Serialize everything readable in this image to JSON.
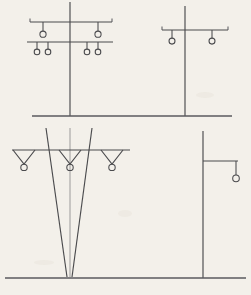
{
  "document": {
    "title": "Utility Pole Configuration Line Drawings",
    "background_color": "#f3f0ea",
    "line_color": "#4a4a4d",
    "width": 251,
    "height": 295
  },
  "figures": [
    {
      "id": "fig-top-left",
      "name": "double-crossarm-pole",
      "label": "Double Crossarm Distribution Pole",
      "pole": {
        "x": 70,
        "top_y": 2,
        "bottom_y": 116
      },
      "crossarms": [
        {
          "name": "upper-crossarm",
          "y": 22,
          "x1": 30,
          "x2": 112,
          "insulators": [
            {
              "x": 43,
              "drop": 9,
              "r": 3.1
            },
            {
              "x": 98,
              "drop": 9,
              "r": 3.1
            }
          ]
        },
        {
          "name": "lower-crossarm",
          "y": 42,
          "x1": 27,
          "x2": 113,
          "insulators": [
            {
              "x": 37,
              "drop": 7,
              "r": 2.8
            },
            {
              "x": 48,
              "drop": 7,
              "r": 2.8
            },
            {
              "x": 87,
              "drop": 7,
              "r": 2.8
            },
            {
              "x": 98,
              "drop": 7,
              "r": 2.8
            }
          ]
        }
      ],
      "insulator_count": 6
    },
    {
      "id": "fig-top-right",
      "name": "single-crossarm-pole",
      "label": "Single Crossarm Pole",
      "pole": {
        "x": 185,
        "top_y": 6,
        "bottom_y": 116
      },
      "crossarms": [
        {
          "name": "crossarm",
          "y": 30,
          "x1": 162,
          "x2": 228,
          "insulators": [
            {
              "x": 172,
              "drop": 8,
              "r": 3.0
            },
            {
              "x": 212,
              "drop": 8,
              "r": 3.0
            }
          ]
        }
      ],
      "insulator_count": 2
    },
    {
      "id": "fig-bottom-left",
      "name": "lattice-tower-front-elevation",
      "label": "Lattice Tower Front Elevation",
      "crossarm": {
        "name": "tower-crossarm",
        "y": 150,
        "x1": 12,
        "x2": 130,
        "v_hangers": [
          {
            "x": 24,
            "half_width": 11,
            "depth": 14,
            "r": 3.2
          },
          {
            "x": 70,
            "half_width": 11,
            "depth": 14,
            "r": 3.2
          },
          {
            "x": 112,
            "half_width": 11,
            "depth": 14,
            "r": 3.2
          }
        ]
      },
      "legs": [
        {
          "name": "left-leg",
          "top_x": 46,
          "top_y": 128,
          "bottom_x": 67,
          "bottom_y": 277
        },
        {
          "name": "center-mast",
          "top_x": 70,
          "top_y": 128,
          "bottom_x": 70,
          "bottom_y": 277
        },
        {
          "name": "right-leg",
          "top_x": 92,
          "top_y": 128,
          "bottom_x": 72,
          "bottom_y": 277
        }
      ],
      "hanger_count": 3
    },
    {
      "id": "fig-bottom-right",
      "name": "side-bracket-pole",
      "label": "Side Bracket Pole",
      "pole": {
        "x": 203,
        "top_y": 131,
        "bottom_y": 278
      },
      "bracket": {
        "name": "side-bracket-arm",
        "y": 161,
        "x1": 203,
        "x2": 238,
        "insulator": {
          "x": 236,
          "drop": 14,
          "r": 3.3
        }
      },
      "insulator_count": 1
    }
  ],
  "ground_lines": [
    {
      "name": "upper-ground-line",
      "y": 116,
      "x1": 32,
      "x2": 232
    },
    {
      "name": "lower-ground-line",
      "y": 278,
      "x1": 5,
      "x2": 246
    }
  ]
}
